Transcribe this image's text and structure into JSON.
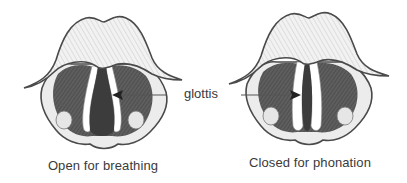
{
  "figure": {
    "label": "glottis",
    "panels": [
      {
        "id": "open",
        "caption": "Open for breathing",
        "state": "open"
      },
      {
        "id": "closed",
        "caption": "Closed for phonation",
        "state": "closed"
      }
    ],
    "colors": {
      "outline": "#4a4a4a",
      "fold_dark": "#555555",
      "epiglottis_shade": "#bcbcbc",
      "text": "#3a3a3a",
      "arrow": "#555555"
    }
  }
}
